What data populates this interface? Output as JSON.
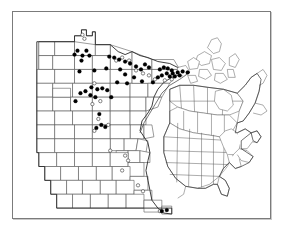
{
  "figure": {
    "kind": "distribution-map",
    "region_label": "Minnesota",
    "inset_label": "North America",
    "frame_color": "#7b7b7b",
    "background_color": "#ffffff",
    "county_line_color": "#4a4a4a",
    "state_outline_color": "#2a2a2a",
    "filled_symbol_color": "#000000",
    "open_symbol_color": "#ffffff"
  },
  "legend": {
    "filled_label": "",
    "open_label": ""
  },
  "chart_data": {
    "type": "scatter",
    "title": "",
    "xlabel": "",
    "ylabel": "",
    "filled_count": 56,
    "open_count": 24,
    "filled_points": [
      [
        65,
        39
      ],
      [
        74,
        39
      ],
      [
        62,
        43
      ],
      [
        70,
        44
      ],
      [
        77,
        44
      ],
      [
        69,
        49
      ],
      [
        67,
        60
      ],
      [
        82,
        59
      ],
      [
        94,
        57
      ],
      [
        108,
        58
      ],
      [
        113,
        63
      ],
      [
        122,
        66
      ],
      [
        105,
        71
      ],
      [
        115,
        72
      ],
      [
        130,
        70
      ],
      [
        141,
        71
      ],
      [
        148,
        58
      ],
      [
        152,
        56
      ],
      [
        156,
        57
      ],
      [
        160,
        59
      ],
      [
        155,
        62
      ],
      [
        161,
        62
      ],
      [
        166,
        61
      ],
      [
        171,
        60
      ],
      [
        176,
        61
      ],
      [
        150,
        64
      ],
      [
        146,
        66
      ],
      [
        158,
        65
      ],
      [
        163,
        65
      ],
      [
        168,
        64
      ],
      [
        133,
        53
      ],
      [
        137,
        56
      ],
      [
        129,
        58
      ],
      [
        124,
        55
      ],
      [
        118,
        52
      ],
      [
        113,
        50
      ],
      [
        107,
        48
      ],
      [
        102,
        46
      ],
      [
        97,
        45
      ],
      [
        79,
        76
      ],
      [
        85,
        78
      ],
      [
        90,
        77
      ],
      [
        95,
        79
      ],
      [
        73,
        80
      ],
      [
        68,
        82
      ],
      [
        78,
        84
      ],
      [
        83,
        86
      ],
      [
        63,
        90
      ],
      [
        99,
        86
      ],
      [
        87,
        103
      ],
      [
        89,
        114
      ],
      [
        93,
        116
      ],
      [
        84,
        117
      ],
      [
        155,
        200
      ],
      [
        150,
        201
      ]
    ],
    "open_points": [
      [
        70,
        23
      ],
      [
        72,
        27
      ],
      [
        110,
        46
      ],
      [
        117,
        49
      ],
      [
        104,
        49
      ],
      [
        124,
        59
      ],
      [
        131,
        62
      ],
      [
        137,
        64
      ],
      [
        143,
        68
      ],
      [
        153,
        69
      ],
      [
        160,
        68
      ],
      [
        82,
        72
      ],
      [
        88,
        90
      ],
      [
        80,
        93
      ],
      [
        86,
        108
      ],
      [
        96,
        114
      ],
      [
        82,
        120
      ],
      [
        98,
        140
      ],
      [
        113,
        145
      ],
      [
        116,
        150
      ],
      [
        110,
        160
      ],
      [
        126,
        175
      ],
      [
        131,
        181
      ],
      [
        148,
        201
      ]
    ],
    "xlim": [
      0,
      259
    ],
    "ylim": [
      0,
      208
    ],
    "grid": false,
    "legend_position": "none"
  }
}
